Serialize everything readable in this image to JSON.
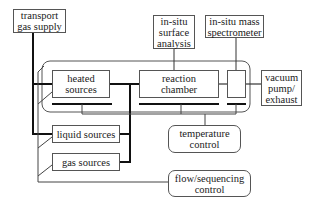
{
  "diagram": {
    "nodes": {
      "transport_gas_supply": "transport\ngas supply",
      "insitu_surface_analysis": "in-situ\nsurface\nanalysis",
      "insitu_mass_spectrometer": "in-situ mass\nspectrometer",
      "heated_sources": "heated\nsources",
      "reaction_chamber": "reaction\nchamber",
      "vacuum_pump_exhaust": "vacuum\npump/\nexhaust",
      "liquid_sources": "liquid sources",
      "gas_sources": "gas sources",
      "temperature_control": "temperature\ncontrol",
      "flow_sequencing_control": "flow/sequencing\ncontrol"
    },
    "edges": [
      {
        "from": "transport gas supply",
        "to": "heated sources",
        "style": "thick"
      },
      {
        "from": "transport gas supply",
        "to": "liquid sources",
        "style": "thick"
      },
      {
        "from": "heated sources",
        "to": "reaction chamber",
        "style": "thick"
      },
      {
        "from": "liquid sources",
        "to": "reaction chamber",
        "style": "thick"
      },
      {
        "from": "gas sources",
        "to": "reaction chamber",
        "style": "thick"
      },
      {
        "from": "reaction chamber",
        "to": "mass spectrometer port",
        "style": "thin"
      },
      {
        "from": "mass spectrometer port",
        "to": "vacuum pump/exhaust",
        "style": "thin"
      },
      {
        "from": "in-situ surface analysis",
        "to": "reaction chamber",
        "style": "thin"
      },
      {
        "from": "in-situ mass spectrometer",
        "to": "mass spectrometer port",
        "style": "thin"
      },
      {
        "from": "temperature control",
        "to": "heated zone",
        "style": "thin"
      },
      {
        "from": "flow/sequencing control",
        "to": "sources",
        "style": "thin"
      }
    ]
  }
}
